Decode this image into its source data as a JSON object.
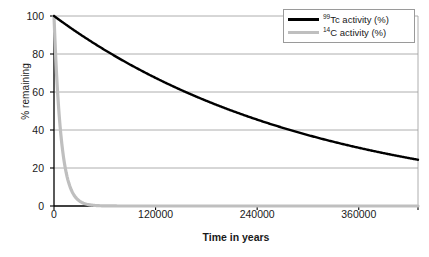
{
  "chart_data": {
    "type": "line",
    "title": "",
    "xlabel": "Time in years",
    "ylabel": "% remaining",
    "xlim": [
      0,
      430000
    ],
    "ylim": [
      0,
      100
    ],
    "grid": true,
    "grid_axis": "y",
    "legend_position": "top-right",
    "x_ticks": [
      {
        "value": 0,
        "label": "0"
      },
      {
        "value": 120000,
        "label": "120000"
      },
      {
        "value": 240000,
        "label": "240000"
      },
      {
        "value": 360000,
        "label": "360000"
      }
    ],
    "y_ticks": [
      {
        "value": 0,
        "label": "0"
      },
      {
        "value": 20,
        "label": "20"
      },
      {
        "value": 40,
        "label": "40"
      },
      {
        "value": 60,
        "label": "60"
      },
      {
        "value": 80,
        "label": "80"
      },
      {
        "value": 100,
        "label": "100"
      }
    ],
    "series": [
      {
        "name": "99Tc activity (%)",
        "label_sup": "99",
        "label_rest": "Tc activity (%)",
        "color": "#000000",
        "half_life_years": 211000,
        "x": [
          0,
          20000,
          40000,
          60000,
          80000,
          100000,
          120000,
          140000,
          160000,
          180000,
          200000,
          220000,
          240000,
          260000,
          280000,
          300000,
          320000,
          340000,
          360000,
          380000,
          400000,
          420000,
          430000
        ],
        "values": [
          100,
          93.7,
          87.8,
          82.3,
          77.1,
          72.3,
          67.7,
          63.4,
          59.4,
          55.7,
          52.2,
          48.9,
          45.8,
          42.9,
          40.2,
          37.7,
          35.3,
          33.1,
          31.0,
          29.1,
          27.2,
          25.5,
          24.7
        ]
      },
      {
        "name": "14C activity (%)",
        "label_sup": "14",
        "label_rest": "C activity (%)",
        "color": "#bfbfbf",
        "half_life_years": 5730,
        "x": [
          0,
          2000,
          4000,
          6000,
          8000,
          10000,
          12000,
          14000,
          16000,
          18000,
          20000,
          24000,
          28000,
          32000,
          36000,
          40000,
          50000,
          60000,
          80000,
          120000,
          200000,
          300000,
          430000
        ],
        "values": [
          100,
          78.5,
          61.6,
          48.4,
          38.0,
          29.8,
          23.4,
          18.4,
          14.4,
          11.3,
          8.9,
          5.5,
          3.4,
          2.1,
          1.3,
          0.8,
          0.2,
          0.07,
          0.006,
          0,
          0,
          0,
          0
        ]
      }
    ]
  },
  "axes": {
    "y_title": "% remaining",
    "x_title": "Time in years"
  },
  "legend": {
    "items": [
      {
        "sup": "99",
        "rest": "Tc activity (%)",
        "color": "#000000"
      },
      {
        "sup": "14",
        "rest": "C activity (%)",
        "color": "#bfbfbf"
      }
    ]
  },
  "caption": {
    "text": ""
  }
}
